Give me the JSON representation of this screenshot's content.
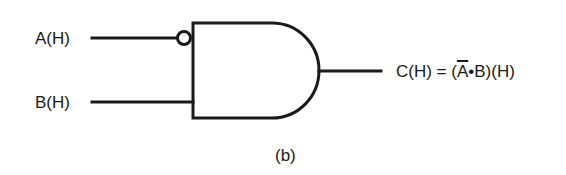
{
  "diagram": {
    "type": "logic-gate",
    "gate": "AND",
    "inputs": [
      {
        "label": "A(H)",
        "inverted": true
      },
      {
        "label": "B(H)",
        "inverted": false
      }
    ],
    "output": {
      "prefix": "C(H) = (",
      "negated_term": "A",
      "operator": "•",
      "term": "B",
      "suffix": ")(H)"
    },
    "caption": "(b)",
    "colors": {
      "stroke": "#1a1a1a",
      "background": "#ffffff"
    }
  }
}
